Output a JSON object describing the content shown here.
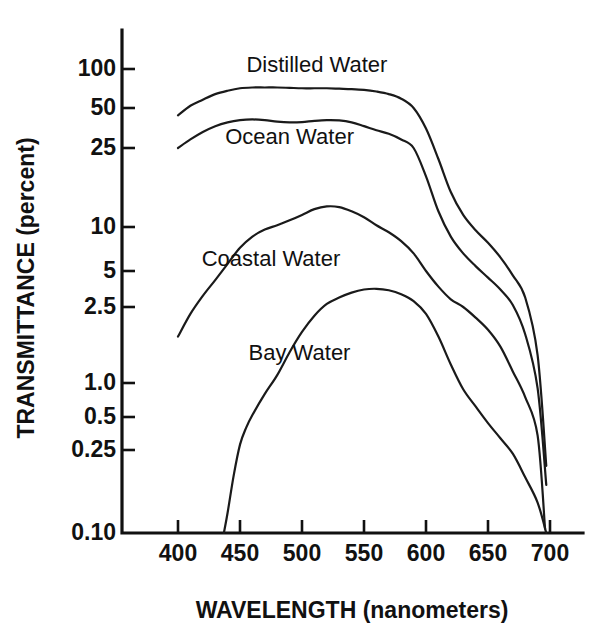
{
  "chart_data": {
    "type": "line",
    "title": "",
    "xlabel": "WAVELENGTH (nanometers)",
    "ylabel": "TRANSMITTANCE  (percent)",
    "xlim": [
      370,
      710
    ],
    "ylim": [
      0.1,
      130
    ],
    "yscale": "log",
    "grid": false,
    "legend_position": "inline-labels",
    "xticks": [
      400,
      450,
      500,
      550,
      600,
      650,
      700
    ],
    "xtick_labels": [
      "400",
      "450",
      "500",
      "550",
      "600",
      "650",
      "700"
    ],
    "yticks": [
      100,
      50,
      25,
      10,
      5,
      2.5,
      1.0,
      0.5,
      0.25,
      0.1
    ],
    "ytick_labels": [
      "100",
      "50",
      "25",
      "10",
      "5",
      "2.5",
      "1.0",
      "0.5",
      "0.25",
      "0.10"
    ],
    "series": [
      {
        "name": "Distilled Water",
        "label_x": 512,
        "label_y": 95,
        "x": [
          400,
          410,
          420,
          430,
          440,
          450,
          460,
          470,
          480,
          490,
          500,
          510,
          520,
          530,
          540,
          550,
          560,
          570,
          580,
          590,
          600,
          610,
          620,
          630,
          640,
          650,
          660,
          670,
          680,
          690,
          697
        ],
        "y": [
          44,
          52,
          58,
          64,
          68,
          71,
          72,
          72,
          72,
          71.5,
          71,
          71,
          71,
          70.5,
          70,
          69,
          67,
          64,
          59,
          50,
          35,
          22,
          15,
          11.5,
          9.5,
          7.8,
          6.2,
          4.6,
          3.0,
          1.4,
          0.21
        ]
      },
      {
        "name": "Ocean Water",
        "label_x": 490,
        "label_y": 27,
        "x": [
          400,
          410,
          420,
          430,
          440,
          450,
          460,
          470,
          480,
          490,
          500,
          510,
          520,
          530,
          540,
          550,
          560,
          570,
          580,
          590,
          600,
          610,
          620,
          630,
          640,
          650,
          660,
          670,
          680,
          690,
          697
        ],
        "y": [
          25,
          29,
          33,
          36.5,
          39,
          40.5,
          41,
          40.5,
          39.5,
          39,
          39.2,
          40,
          40.5,
          40.3,
          39,
          36.5,
          34,
          32,
          29,
          25,
          18,
          12,
          8.6,
          6.6,
          5.4,
          4.4,
          3.5,
          2.6,
          1.8,
          0.9,
          0.17
        ]
      },
      {
        "name": "Coastal Water",
        "label_x": 475,
        "label_y": 5.4,
        "x": [
          400,
          410,
          420,
          430,
          440,
          450,
          460,
          470,
          480,
          490,
          500,
          510,
          520,
          530,
          540,
          550,
          560,
          570,
          580,
          590,
          600,
          610,
          620,
          630,
          640,
          650,
          660,
          670,
          680,
          690,
          696
        ],
        "y": [
          1.75,
          2.3,
          3.1,
          4.2,
          5.6,
          7.2,
          8.6,
          9.6,
          10.2,
          10.8,
          11.5,
          12.3,
          12.7,
          12.6,
          12.0,
          11.2,
          10.2,
          9.2,
          8.0,
          6.6,
          5.0,
          3.7,
          2.9,
          2.5,
          2.2,
          1.9,
          1.55,
          1.15,
          0.75,
          0.34,
          0.105
        ]
      },
      {
        "name": "Bay Water",
        "label_x": 498,
        "label_y": 1.32,
        "x": [
          437,
          440,
          445,
          450,
          455,
          460,
          470,
          480,
          490,
          500,
          510,
          520,
          530,
          540,
          550,
          560,
          570,
          580,
          590,
          600,
          610,
          620,
          630,
          640,
          650,
          660,
          670,
          680,
          690,
          697
        ],
        "y": [
          0.1,
          0.125,
          0.19,
          0.28,
          0.4,
          0.52,
          0.8,
          1.1,
          1.45,
          1.85,
          2.25,
          2.65,
          3.0,
          3.3,
          3.5,
          3.55,
          3.45,
          3.2,
          2.8,
          2.3,
          1.75,
          1.25,
          0.88,
          0.62,
          0.44,
          0.32,
          0.24,
          0.185,
          0.14,
          0.1
        ]
      }
    ]
  },
  "axes": {
    "y_axis_title": "TRANSMITTANCE  (percent)",
    "x_axis_title": "WAVELENGTH (nanometers)"
  }
}
